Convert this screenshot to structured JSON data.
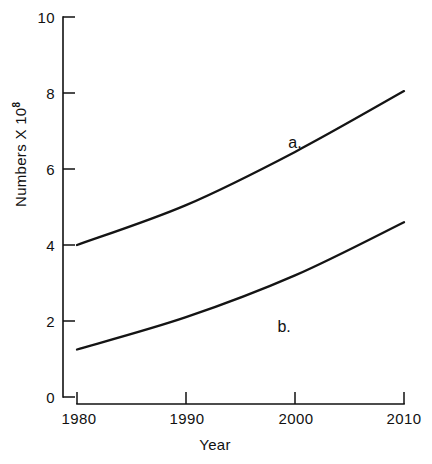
{
  "chart_data": {
    "type": "line",
    "title": "",
    "xlabel": "Year",
    "ylabel": "Numbers X 10",
    "ylabel_exponent": "8",
    "x": [
      1980,
      1990,
      2000,
      2010
    ],
    "xtick_labels": [
      "1980",
      "1990",
      "2000",
      "2010"
    ],
    "ytick_labels": [
      "0",
      "2",
      "4",
      "6",
      "8",
      "10"
    ],
    "ytick_values": [
      0,
      2,
      4,
      6,
      8,
      10
    ],
    "xlim": [
      1980,
      2010
    ],
    "ylim": [
      0,
      10
    ],
    "grid": false,
    "legend": "inline-labels",
    "series": [
      {
        "name": "a.",
        "label": "a.",
        "label_x": 2000,
        "label_y": 6.55,
        "values": [
          4.0,
          5.05,
          6.45,
          8.05
        ]
      },
      {
        "name": "b.",
        "label": "b.",
        "label_x": 1999,
        "label_y": 1.7,
        "values": [
          1.25,
          2.1,
          3.2,
          4.6
        ]
      }
    ]
  },
  "figure": {
    "ghost_top_text": "",
    "background_color": "#ffffff",
    "ink_color": "#111111"
  }
}
